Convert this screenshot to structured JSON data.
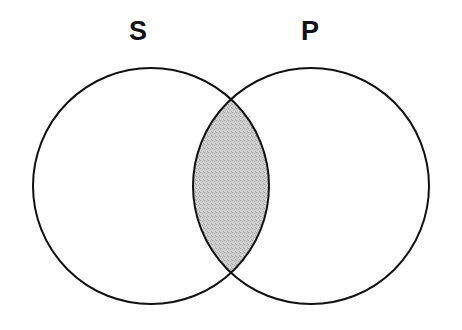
{
  "figure": {
    "type": "venn-diagram",
    "title": "",
    "background_color": "#ffffff",
    "width": 462,
    "height": 330,
    "stroke_color": "#111111",
    "stroke_width": 2,
    "shade_color": "#c8c8c8",
    "shade_pattern": "dithered-gray-stipple"
  },
  "labels": {
    "left_set": "S",
    "right_set": "P"
  },
  "sets": [
    {
      "name": "S",
      "label": "S",
      "center_x": 151,
      "center_y": 186,
      "radius": 118,
      "fill": "none",
      "shaded": false
    },
    {
      "name": "P",
      "label": "P",
      "center_x": 311,
      "center_y": 186,
      "radius": 118,
      "fill": "none",
      "shaded": false
    }
  ],
  "regions": [
    {
      "name": "S-only",
      "shaded": false,
      "fill": "#ffffff"
    },
    {
      "name": "P-only",
      "shaded": false,
      "fill": "#ffffff"
    },
    {
      "name": "S-and-P-intersection",
      "shaded": true,
      "fill": "#c8c8c8"
    }
  ],
  "intersection": {
    "label": "S ∩ P",
    "shaded": true,
    "top_point_x": 231,
    "top_point_y": 104,
    "bottom_point_x": 231,
    "bottom_point_y": 272,
    "left_edge_x": 193,
    "right_edge_x": 269
  }
}
